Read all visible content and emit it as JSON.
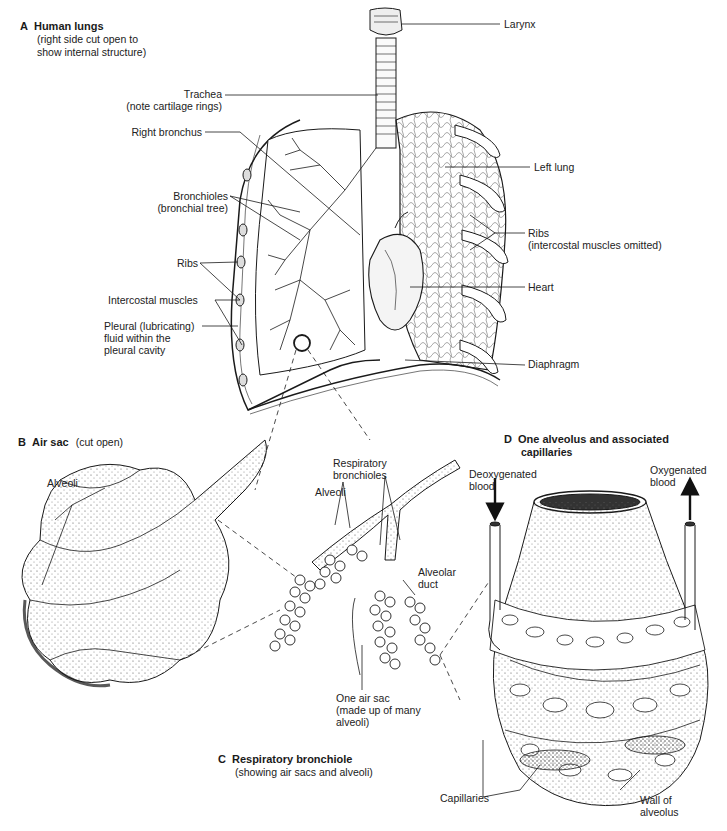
{
  "panels": {
    "A": {
      "letter": "A",
      "title": "Human lungs",
      "subtitle_1": "(right side cut open to",
      "subtitle_2": "show internal structure)",
      "labels": {
        "larynx": "Larynx",
        "trachea": "Trachea",
        "trachea_note": "(note cartilage rings)",
        "right_bronchus": "Right bronchus",
        "left_lung": "Left lung",
        "bronchioles": "Bronchioles",
        "bronchioles_note": "(bronchial tree)",
        "ribs_left": "Ribs",
        "ribs_right": "Ribs",
        "ribs_right_note": "(intercostal muscles omitted)",
        "intercostal_muscles": "Intercostal muscles",
        "heart": "Heart",
        "pleural_1": "Pleural (lubricating)",
        "pleural_2": "fluid within the",
        "pleural_3": "pleural cavity",
        "diaphragm": "Diaphragm"
      }
    },
    "B": {
      "letter": "B",
      "title": "Air sac",
      "subtitle": "(cut open)",
      "labels": {
        "alveoli": "Alveoli"
      }
    },
    "C": {
      "letter": "C",
      "title": "Respiratory bronchiole",
      "subtitle": "(showing air sacs and alveoli)",
      "labels": {
        "respiratory_1": "Respiratory",
        "respiratory_2": "bronchioles",
        "alveoli": "Alveoli",
        "alveolar_1": "Alveolar",
        "alveolar_2": "duct",
        "air_sac_1": "One air sac",
        "air_sac_2": "(made up of many",
        "air_sac_3": "alveoli)"
      }
    },
    "D": {
      "letter": "D",
      "title_1": "One alveolus and associated",
      "title_2": "capillaries",
      "labels": {
        "deoxy_1": "Deoxygenated",
        "deoxy_2": "blood",
        "oxy_1": "Oxygenated",
        "oxy_2": "blood",
        "capillaries": "Capillaries",
        "wall_1": "Wall of",
        "wall_2": "alveolus"
      }
    }
  }
}
